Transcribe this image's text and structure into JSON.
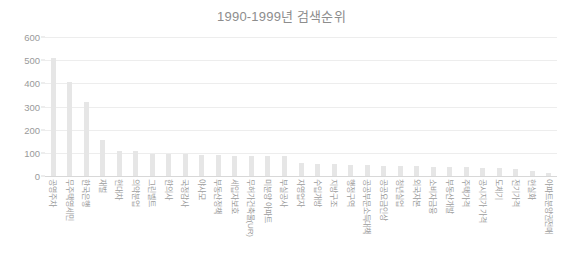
{
  "chart_data": {
    "type": "bar",
    "title": "1990-1999년 검색순위",
    "xlabel": "",
    "ylabel": "",
    "ylim": [
      0,
      600
    ],
    "yticks": [
      0,
      100,
      200,
      300,
      400,
      500,
      600
    ],
    "grid": true,
    "legend": false,
    "orientation": "vertical",
    "bar_color": "#e6e6e6",
    "categories": [
      "공영주차",
      "무주택영세민",
      "한국은행",
      "재벌",
      "현대차",
      "의약분업",
      "그린벨트",
      "한의사",
      "국정감사",
      "야사모",
      "부동산정책",
      "세입자보호",
      "무허가건축물(UR)",
      "미분양 아파트",
      "부실공사",
      "자영업자",
      "수입개방",
      "지방구조",
      "행정구역",
      "공공부문소득대책",
      "공공요금인상",
      "청년실업",
      "외국자본",
      "소비자금융",
      "부동산개발",
      "주택가격",
      "공시지가 가격",
      "도체기",
      "전기가격",
      "현실화",
      "아파트분양권전매"
    ],
    "values": [
      510,
      405,
      320,
      155,
      108,
      108,
      97,
      95,
      93,
      90,
      90,
      88,
      88,
      86,
      85,
      55,
      52,
      50,
      48,
      47,
      45,
      44,
      42,
      41,
      40,
      38,
      36,
      34,
      30,
      22,
      12
    ]
  }
}
